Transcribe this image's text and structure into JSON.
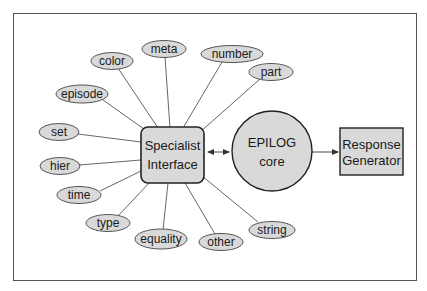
{
  "diagram": {
    "colors": {
      "background": "#ffffff",
      "frame": "#555555",
      "node_fill": "#d9d9d9",
      "node_stroke": "#333333",
      "edge": "#555555",
      "text": "#1a1a1a"
    },
    "hub": {
      "label_line1": "Specialist",
      "label_line2": "Interface"
    },
    "core": {
      "label_line1": "EPILOG",
      "label_line2": "core"
    },
    "output": {
      "label_line1": "Response",
      "label_line2": "Generator"
    },
    "specialists": [
      {
        "label": "color"
      },
      {
        "label": "meta"
      },
      {
        "label": "number"
      },
      {
        "label": "part"
      },
      {
        "label": "episode"
      },
      {
        "label": "set"
      },
      {
        "label": "hier"
      },
      {
        "label": "time"
      },
      {
        "label": "type"
      },
      {
        "label": "equality"
      },
      {
        "label": "other"
      },
      {
        "label": "string"
      }
    ],
    "edges": [
      {
        "from": "Specialist Interface",
        "to": "EPILOG core",
        "type": "bidirectional-arrow"
      },
      {
        "from": "EPILOG core",
        "to": "Response Generator",
        "type": "arrow"
      },
      {
        "from": "Specialist Interface",
        "to": "color",
        "type": "line"
      },
      {
        "from": "Specialist Interface",
        "to": "meta",
        "type": "line"
      },
      {
        "from": "Specialist Interface",
        "to": "number",
        "type": "line"
      },
      {
        "from": "Specialist Interface",
        "to": "part",
        "type": "line"
      },
      {
        "from": "Specialist Interface",
        "to": "episode",
        "type": "line"
      },
      {
        "from": "Specialist Interface",
        "to": "set",
        "type": "line"
      },
      {
        "from": "Specialist Interface",
        "to": "hier",
        "type": "line"
      },
      {
        "from": "Specialist Interface",
        "to": "time",
        "type": "line"
      },
      {
        "from": "Specialist Interface",
        "to": "type",
        "type": "line"
      },
      {
        "from": "Specialist Interface",
        "to": "equality",
        "type": "line"
      },
      {
        "from": "Specialist Interface",
        "to": "other",
        "type": "line"
      },
      {
        "from": "Specialist Interface",
        "to": "string",
        "type": "line"
      }
    ]
  }
}
